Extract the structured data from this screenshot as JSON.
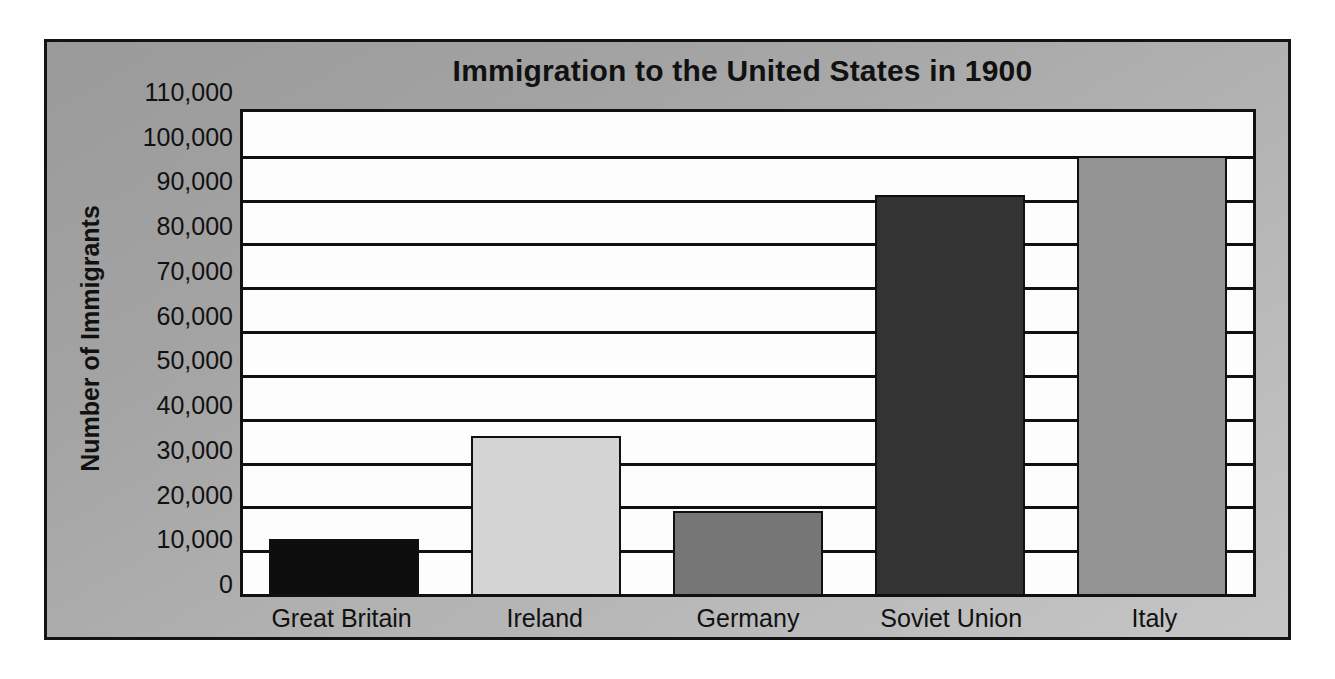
{
  "chart_data": {
    "type": "bar",
    "title": "Immigration to the United States in 1900",
    "xlabel": "",
    "ylabel": "Number of Immigrants",
    "categories": [
      "Great Britain",
      "Ireland",
      "Germany",
      "Soviet Union",
      "Italy"
    ],
    "values": [
      12500,
      36000,
      19000,
      91000,
      100000
    ],
    "series": [
      {
        "name": "Number of Immigrants",
        "values": [
          12500,
          36000,
          19000,
          91000,
          100000
        ]
      }
    ],
    "bar_colors": [
      "#0d0d0d",
      "#d4d4d4",
      "#767676",
      "#333333",
      "#939393"
    ],
    "ylim": [
      0,
      110000
    ],
    "ytick_values": [
      0,
      10000,
      20000,
      30000,
      40000,
      50000,
      60000,
      70000,
      80000,
      90000,
      100000,
      110000
    ],
    "ytick_labels": [
      "110,000",
      "100,000",
      "90,000",
      "80,000",
      "70,000",
      "60,000",
      "50,000",
      "40,000",
      "30,000",
      "20,000",
      "10,000",
      "0"
    ],
    "grid": true,
    "grid_axis": "y",
    "legend": false,
    "legend_position": "none",
    "plot_background": "#fdfdfd",
    "figure_background": "#aaaaaa",
    "frame_color": "#131313",
    "text_color": "#111111"
  }
}
